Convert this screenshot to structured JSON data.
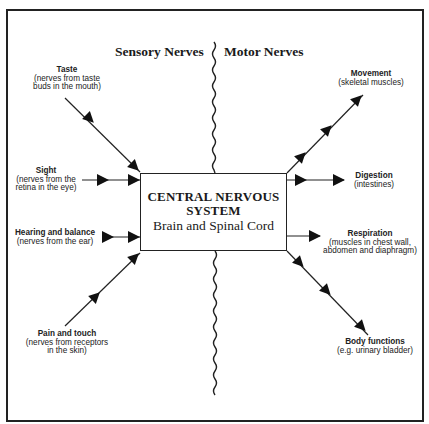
{
  "diagram": {
    "headings": {
      "sensory": "Sensory Nerves",
      "motor": "Motor Nerves"
    },
    "center": {
      "title_line1": "CENTRAL NERVOUS",
      "title_line2": "SYSTEM",
      "subtitle": "Brain and Spinal Cord"
    },
    "sensory_inputs": [
      {
        "title": "Taste",
        "desc_line1": "(nerves from taste",
        "desc_line2": "buds in the mouth)"
      },
      {
        "title": "Sight",
        "desc_line1": "(nerves from the",
        "desc_line2": "retina in the eye)"
      },
      {
        "title": "Hearing and balance",
        "desc_line1": "(nerves from the ear)",
        "desc_line2": ""
      },
      {
        "title": "Pain and touch",
        "desc_line1": "(nerves from receptors",
        "desc_line2": "in the skin)"
      }
    ],
    "motor_outputs": [
      {
        "title": "Movement",
        "desc_line1": "(skeletal muscles)",
        "desc_line2": ""
      },
      {
        "title": "Digestion",
        "desc_line1": "(intestines)",
        "desc_line2": ""
      },
      {
        "title": "Respiration",
        "desc_line1": "(muscles in chest wall,",
        "desc_line2": "abdomen and diaphragm)"
      },
      {
        "title": "Body functions",
        "desc_line1": "(e.g. urinary bladder)",
        "desc_line2": ""
      }
    ],
    "colors": {
      "line": "#222222",
      "background": "#ffffff"
    }
  }
}
